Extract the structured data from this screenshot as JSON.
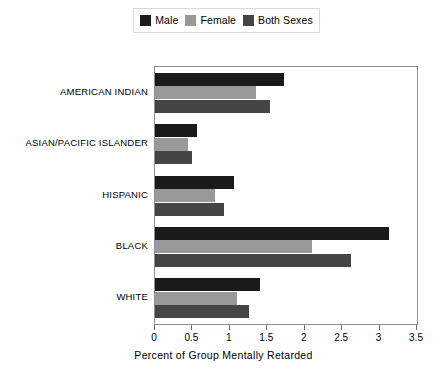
{
  "chart_data": {
    "type": "bar",
    "orientation": "horizontal",
    "title": "",
    "xlabel": "Percent of Group Mentally Retarded",
    "ylabel": "",
    "xlim": [
      0,
      3.5
    ],
    "xticks": [
      "0",
      "0.5",
      "1",
      "1.5",
      "2",
      "2.5",
      "3",
      "3.5"
    ],
    "xtick_values": [
      0,
      0.5,
      1,
      1.5,
      2,
      2.5,
      3,
      3.5
    ],
    "grid": false,
    "legend_position": "top-center",
    "categories": [
      "AMERICAN INDIAN",
      "ASIAN/PACIFIC ISLANDER",
      "HISPANIC",
      "BLACK",
      "WHITE"
    ],
    "series": [
      {
        "name": "Male",
        "color": "#1a1a1a",
        "values": [
          1.72,
          0.56,
          1.05,
          3.12,
          1.4
        ]
      },
      {
        "name": "Female",
        "color": "#999999",
        "values": [
          1.35,
          0.44,
          0.8,
          2.1,
          1.1
        ]
      },
      {
        "name": "Both Sexes",
        "color": "#454545",
        "values": [
          1.53,
          0.5,
          0.92,
          2.62,
          1.25
        ]
      }
    ]
  },
  "legend": {
    "items": [
      {
        "label": "Male",
        "color": "#1a1a1a"
      },
      {
        "label": "Female",
        "color": "#999999"
      },
      {
        "label": "Both Sexes",
        "color": "#454545"
      }
    ]
  },
  "axis": {
    "x_title": "Percent of Group Mentally Retarded"
  }
}
